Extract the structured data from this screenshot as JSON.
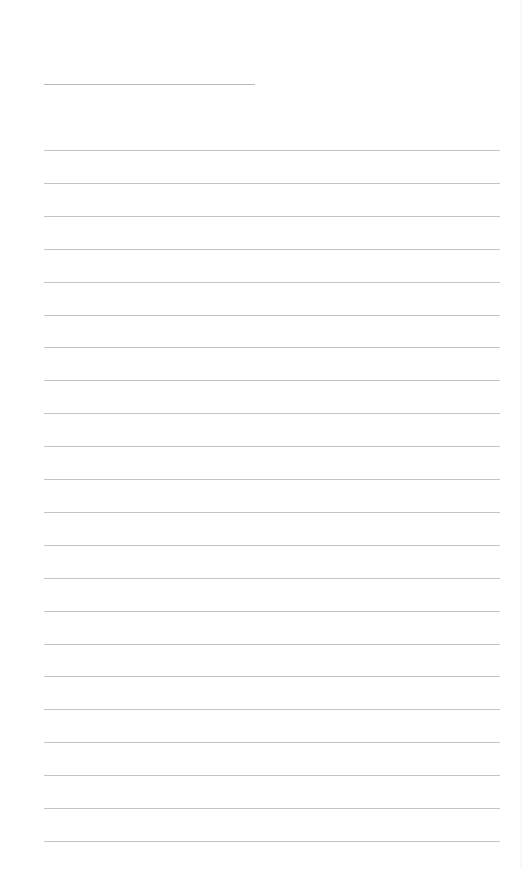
{
  "page": {
    "type": "lined-blank-sheet",
    "background_color": "#ffffff",
    "line_color": "#c4c4c4",
    "header_line": {
      "y": 84,
      "x_start": 44,
      "x_end": 255
    },
    "ruled_lines": {
      "count": 22,
      "first_y": 150,
      "last_y": 841,
      "x_start": 44,
      "x_end": 500
    }
  }
}
